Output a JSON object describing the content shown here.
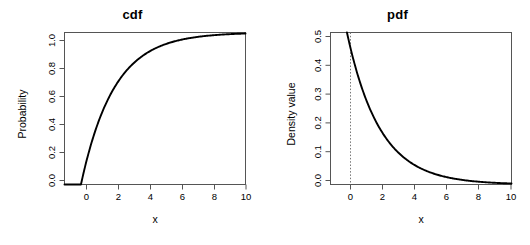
{
  "figure": {
    "background": "#ffffff",
    "line_color": "#000000",
    "axis_color": "#555555",
    "guide_color": "#777777",
    "width": 530,
    "height": 245
  },
  "panels": [
    {
      "key": "cdf",
      "title": "cdf",
      "xlabel": "x",
      "ylabel": "Probability",
      "x_ticks": [
        "0",
        "2",
        "4",
        "6",
        "8",
        "10"
      ],
      "y_ticks": [
        "0.0",
        "0.2",
        "0.4",
        "0.6",
        "0.8",
        "1.0"
      ]
    },
    {
      "key": "pdf",
      "title": "pdf",
      "xlabel": "x",
      "ylabel": "Density value",
      "x_ticks": [
        "0",
        "2",
        "4",
        "6",
        "8",
        "10"
      ],
      "y_ticks": [
        "0.0",
        "0.1",
        "0.2",
        "0.3",
        "0.4",
        "0.5"
      ]
    }
  ],
  "chart_data": [
    {
      "type": "line",
      "title": "cdf",
      "xlabel": "x",
      "ylabel": "Probability",
      "xlim": [
        -1,
        10
      ],
      "ylim": [
        0,
        1
      ],
      "xticks": [
        0,
        2,
        4,
        6,
        8,
        10
      ],
      "yticks": [
        0.0,
        0.2,
        0.4,
        0.6,
        0.8,
        1.0
      ],
      "grid": false,
      "legend": "none",
      "distribution": "exponential",
      "rate": 0.5,
      "formula": "F(x) = 1 - exp(-0.5x) for x >= 0, else 0",
      "series": [
        {
          "name": "F(x)",
          "x": [
            -1.0,
            -0.5,
            0.0,
            0.25,
            0.5,
            0.75,
            1.0,
            1.5,
            2.0,
            2.5,
            3.0,
            3.5,
            4.0,
            4.5,
            5.0,
            5.5,
            6.0,
            6.5,
            7.0,
            7.5,
            8.0,
            8.5,
            9.0,
            9.5,
            10.0
          ],
          "y": [
            0.0,
            0.0,
            0.0,
            0.1175,
            0.2212,
            0.3127,
            0.3935,
            0.5276,
            0.6321,
            0.7135,
            0.7769,
            0.8262,
            0.8647,
            0.8946,
            0.9179,
            0.9361,
            0.9502,
            0.9612,
            0.9698,
            0.9765,
            0.9817,
            0.9857,
            0.9889,
            0.9913,
            0.9933
          ]
        }
      ]
    },
    {
      "type": "line",
      "title": "pdf",
      "xlabel": "x",
      "ylabel": "Density value",
      "xlim": [
        -1,
        10
      ],
      "ylim": [
        0,
        0.5
      ],
      "xticks": [
        0,
        2,
        4,
        6,
        8,
        10
      ],
      "yticks": [
        0.0,
        0.1,
        0.2,
        0.3,
        0.4,
        0.5
      ],
      "grid": false,
      "legend": "none",
      "distribution": "exponential",
      "rate": 0.5,
      "formula": "f(x) = 0.5 * exp(-0.5x) for x >= 0",
      "annotations": [
        {
          "type": "vertical-dotted-line",
          "x": 0,
          "label": "x = 0"
        }
      ],
      "series": [
        {
          "name": "f(x)",
          "x": [
            0.0,
            0.25,
            0.5,
            0.75,
            1.0,
            1.5,
            2.0,
            2.5,
            3.0,
            3.5,
            4.0,
            4.5,
            5.0,
            5.5,
            6.0,
            6.5,
            7.0,
            7.5,
            8.0,
            8.5,
            9.0,
            9.5,
            10.0
          ],
          "y": [
            0.5,
            0.4412,
            0.3894,
            0.3436,
            0.3033,
            0.2362,
            0.1839,
            0.1433,
            0.1116,
            0.0869,
            0.0677,
            0.0527,
            0.041,
            0.032,
            0.0249,
            0.0194,
            0.0151,
            0.0117,
            0.0092,
            0.0071,
            0.0056,
            0.0043,
            0.0034
          ]
        }
      ]
    }
  ]
}
